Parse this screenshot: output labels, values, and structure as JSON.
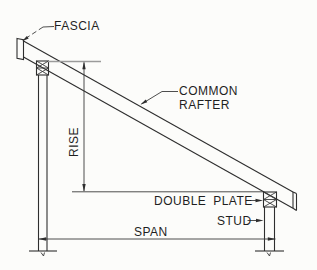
{
  "diagram": {
    "background_color": "#fcfcfa",
    "line_color": "#2e2e2e",
    "reference_line_color": "#9b9b9b",
    "labels": {
      "fascia": "FASCIA",
      "common_rafter": {
        "line1": "COMMON",
        "line2": "RAFTER"
      },
      "rise": "RISE",
      "double_plate": "DOUBLE PLATE",
      "stud": "STUD",
      "span": "SPAN"
    }
  }
}
